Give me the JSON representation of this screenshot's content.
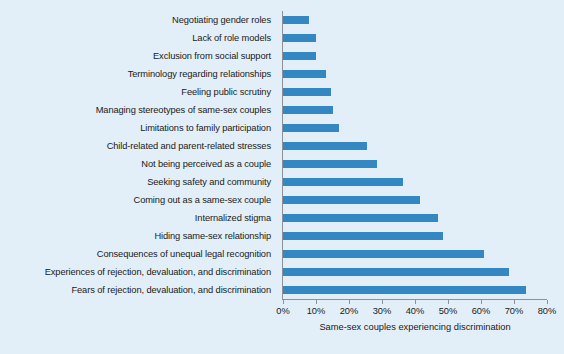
{
  "chart_data": {
    "type": "bar",
    "orientation": "horizontal",
    "title": "",
    "xlabel": "Same-sex couples experiencing discrimination",
    "ylabel": "",
    "xlim": [
      0,
      80
    ],
    "xtick_labels": [
      "0%",
      "10%",
      "20%",
      "30%",
      "40%",
      "50%",
      "60%",
      "70%",
      "80%"
    ],
    "xticks": [
      0,
      10,
      20,
      30,
      40,
      50,
      60,
      70,
      80
    ],
    "grid": false,
    "legend": false,
    "bar_color": "#3387c3",
    "background_color": "#e2eff8",
    "axis_color": "#8e9194",
    "categories": [
      "Negotiating gender roles",
      "Lack of role models",
      "Exclusion from social support",
      "Terminology regarding relationships",
      "Feeling public scrutiny",
      "Managing stereotypes of same-sex couples",
      "Limitations to family participation",
      "Child-related and parent-related stresses",
      "Not being perceived as a couple",
      "Seeking safety and community",
      "Coming out as a same-sex couple",
      "Internalized stigma",
      "Hiding same-sex relationship",
      "Consequences of unequal legal recognition",
      "Experiences of rejection, devaluation, and discrimination",
      "Fears of rejection, devaluation, and discrimination"
    ],
    "values": [
      8,
      10,
      10,
      13,
      14.5,
      15,
      17,
      25.5,
      28.5,
      36.5,
      41.5,
      47,
      48.5,
      61,
      68.5,
      73.5
    ]
  }
}
